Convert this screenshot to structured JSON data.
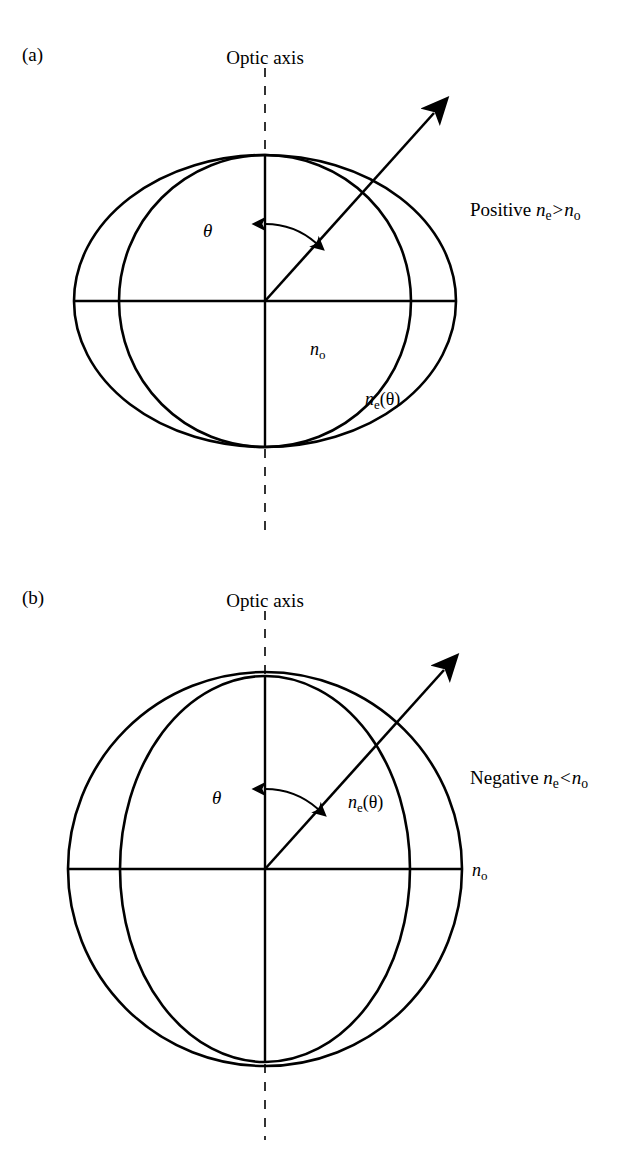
{
  "figure": {
    "background_color": "#ffffff",
    "stroke_color": "#000000",
    "panels": [
      {
        "tag": "(a)",
        "tag_x": 30,
        "tag_y": 45,
        "optic_axis_label": "Optic axis",
        "optic_axis_label_x": 265,
        "optic_axis_label_y": 48,
        "type_note_prefix": "Positive",
        "type_note_relation": ">",
        "type_note_x": 470,
        "type_note_y": 209,
        "theta_symbol": "θ",
        "theta_x": 203,
        "theta_y": 228,
        "ordinary_label": "n",
        "ordinary_sub": "o",
        "ordinary_label_x": 310,
        "ordinary_label_y": 347,
        "extraordinary_label": "n",
        "extraordinary_sub": "e",
        "extraordinary_arg": "(θ)",
        "extraordinary_label_x": 367,
        "extraordinary_label_y": 397,
        "center_x": 265,
        "center_y": 301,
        "circle_radius": 146,
        "ellipse_rx": 191,
        "ellipse_ry": 146,
        "ray_angle_deg": 42,
        "ray_length": 253
      },
      {
        "tag": "(b)",
        "tag_x": 30,
        "tag_y": 588,
        "optic_axis_label": "Optic axis",
        "optic_axis_label_x": 265,
        "optic_axis_label_y": 591,
        "type_note_prefix": "Negative",
        "type_note_relation": "<",
        "type_note_x": 470,
        "type_note_y": 777,
        "theta_symbol": "θ",
        "theta_x": 212,
        "theta_y": 795,
        "ordinary_label": "n",
        "ordinary_sub": "o",
        "ordinary_label_x": 480,
        "ordinary_label_y": 869,
        "extraordinary_label": "n",
        "extraordinary_sub": "e",
        "extraordinary_arg": "(θ)",
        "extraordinary_label_x": 350,
        "extraordinary_label_y": 800,
        "center_x": 265,
        "center_y": 869,
        "circle_radius": 197,
        "ellipse_rx": 145,
        "ellipse_ry": 193,
        "ray_angle_deg": 42,
        "ray_length": 268
      }
    ],
    "symbols": {
      "refractive_index": "n",
      "ordinary_subscript": "o",
      "extraordinary_subscript": "e",
      "angle": "θ"
    }
  }
}
